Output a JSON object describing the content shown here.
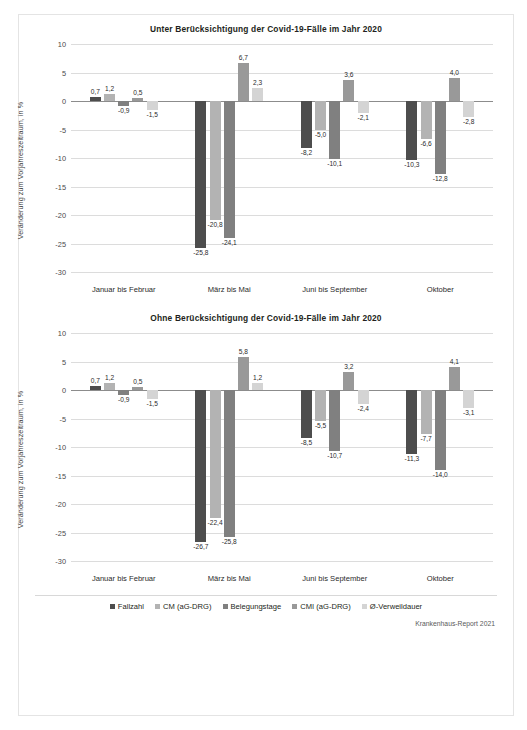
{
  "figure": {
    "source_note": "Krankenhaus-Report 2021",
    "ylabel": "Veränderung zum Vorjahreszeitraum, in %",
    "legend": [
      {
        "label": "Fallzahl",
        "color": "#4d4d4d"
      },
      {
        "label": "CM (aG-DRG)",
        "color": "#b3b3b3"
      },
      {
        "label": "Belegungstage",
        "color": "#808080"
      },
      {
        "label": "CMI (aG-DRG)",
        "color": "#999999"
      },
      {
        "label": "Ø-Verweildauer",
        "color": "#d4d4d4"
      }
    ]
  },
  "chart_data": [
    {
      "type": "bar",
      "title": "Unter Berücksichtigung der Covid-19-Fälle im Jahr 2020",
      "xlabel": "",
      "ylabel": "Veränderung zum Vorjahreszeitraum, in %",
      "ylim": [
        -30,
        10
      ],
      "yticks": [
        10,
        5,
        0,
        -5,
        -10,
        -15,
        -20,
        -25,
        -30
      ],
      "ytick_labels": [
        "10",
        "5",
        "0",
        "-5",
        "-10",
        "-15",
        "-20",
        "-25",
        "-30"
      ],
      "grid": true,
      "legend_position": "bottom",
      "categories": [
        "Januar bis Februar",
        "März bis Mai",
        "Juni bis September",
        "Oktober"
      ],
      "series": [
        {
          "name": "Fallzahl",
          "color": "#4d4d4d",
          "values": [
            0.7,
            -25.8,
            -8.2,
            -10.3
          ],
          "labels": [
            "0,7",
            "-25,8",
            "-8,2",
            "-10,3"
          ]
        },
        {
          "name": "CM (aG-DRG)",
          "color": "#b3b3b3",
          "values": [
            1.2,
            -20.8,
            -5.0,
            -6.6
          ],
          "labels": [
            "1,2",
            "-20,8",
            "-5,0",
            "-6,6"
          ]
        },
        {
          "name": "Belegungstage",
          "color": "#808080",
          "values": [
            -0.9,
            -24.1,
            -10.1,
            -12.8
          ],
          "labels": [
            "-0,9",
            "-24,1",
            "-10,1",
            "-12,8"
          ]
        },
        {
          "name": "CMI (aG-DRG)",
          "color": "#999999",
          "values": [
            0.5,
            6.7,
            3.6,
            4.0
          ],
          "labels": [
            "0,5",
            "6,7",
            "3,6",
            "4,0"
          ]
        },
        {
          "name": "Ø-Verweildauer",
          "color": "#d4d4d4",
          "values": [
            -1.5,
            2.3,
            -2.1,
            -2.8
          ],
          "labels": [
            "-1,5",
            "2,3",
            "-2,1",
            "-2,8"
          ]
        }
      ]
    },
    {
      "type": "bar",
      "title": "Ohne Berücksichtigung der Covid-19-Fälle im Jahr 2020",
      "xlabel": "",
      "ylabel": "Veränderung zum Vorjahreszeitraum, in %",
      "ylim": [
        -30,
        10
      ],
      "yticks": [
        10,
        5,
        0,
        -5,
        -10,
        -15,
        -20,
        -25,
        -30
      ],
      "ytick_labels": [
        "10",
        "5",
        "0",
        "-5",
        "-10",
        "-15",
        "-20",
        "-25",
        "-30"
      ],
      "grid": true,
      "legend_position": "bottom",
      "categories": [
        "Januar bis Februar",
        "März bis Mai",
        "Juni bis September",
        "Oktober"
      ],
      "series": [
        {
          "name": "Fallzahl",
          "color": "#4d4d4d",
          "values": [
            0.7,
            -26.7,
            -8.5,
            -11.3
          ],
          "labels": [
            "0,7",
            "-26,7",
            "-8,5",
            "-11,3"
          ]
        },
        {
          "name": "CM (aG-DRG)",
          "color": "#b3b3b3",
          "values": [
            1.2,
            -22.4,
            -5.5,
            -7.7
          ],
          "labels": [
            "1,2",
            "-22,4",
            "-5,5",
            "-7,7"
          ]
        },
        {
          "name": "Belegungstage",
          "color": "#808080",
          "values": [
            -0.9,
            -25.8,
            -10.7,
            -14.0
          ],
          "labels": [
            "-0,9",
            "-25,8",
            "-10,7",
            "-14,0"
          ]
        },
        {
          "name": "CMI (aG-DRG)",
          "color": "#999999",
          "values": [
            0.5,
            5.8,
            3.2,
            4.1
          ],
          "labels": [
            "0,5",
            "5,8",
            "3,2",
            "4,1"
          ]
        },
        {
          "name": "Ø-Verweildauer",
          "color": "#d4d4d4",
          "values": [
            -1.5,
            1.2,
            -2.4,
            -3.1
          ],
          "labels": [
            "-1,5",
            "1,2",
            "-2,4",
            "-3,1"
          ]
        }
      ]
    }
  ]
}
